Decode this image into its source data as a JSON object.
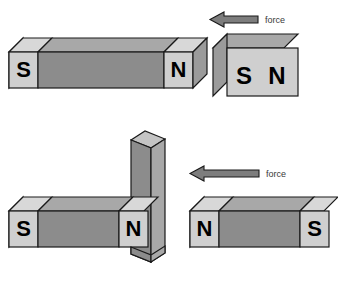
{
  "figure": {
    "background_color": "#ffffff",
    "palette": {
      "outline": "#1a1a1a",
      "body_front": "#8c8c8c",
      "body_top": "#a8a8a8",
      "body_end": "#9b9b9b",
      "pole_front": "#cfcfcf",
      "pole_top": "#d8d8d8",
      "pole_end": "#bdbdbd",
      "arrow_fill": "#7d7d7d",
      "label_text": "#000000",
      "force_text": "#3a3a3a"
    }
  },
  "scenes": {
    "top": {
      "name": "repulsion-like-poles",
      "long_magnet": {
        "left_pole": "S",
        "right_pole": "N"
      },
      "end_on_magnet": {
        "front_face_labels": [
          "S",
          "N"
        ]
      },
      "force_arrow": {
        "label": "force",
        "direction": "left"
      }
    },
    "bottom_left": {
      "name": "bar-magnet-with-vertical-plate",
      "long_magnet": {
        "left_pole": "S",
        "right_pole": "N"
      },
      "vertical_plate": {
        "label": ""
      }
    },
    "bottom_right": {
      "name": "attraction-unlike-poles",
      "long_magnet": {
        "left_pole": "N",
        "right_pole": "S"
      },
      "force_arrow": {
        "label": "force",
        "direction": "left"
      }
    }
  }
}
